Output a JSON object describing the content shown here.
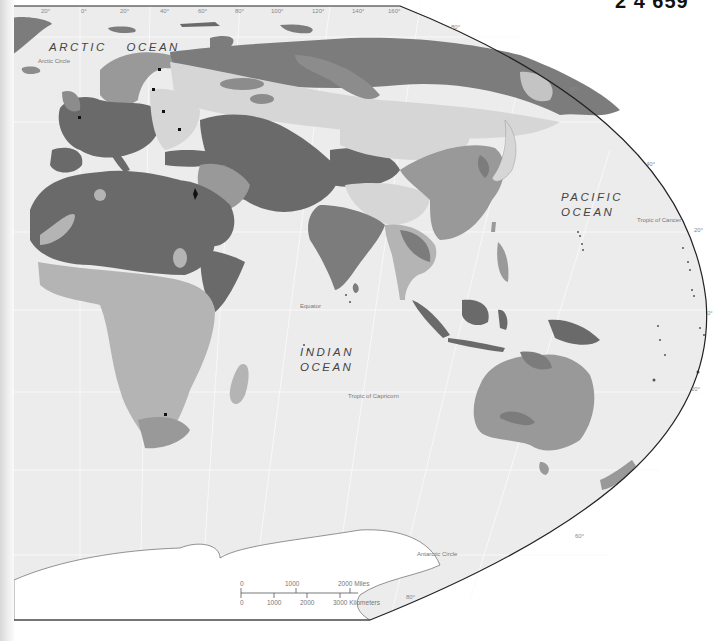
{
  "map": {
    "title_fragment": "2 4 659",
    "colors": {
      "ocean": "#ececec",
      "darkest": "#6a6a6a",
      "dark": "#7c7c7c",
      "medium": "#999999",
      "light": "#b4b4b4",
      "lightest": "#d6d6d6",
      "outside": "#ffffff",
      "border_line": "#222222"
    },
    "oceans": [
      {
        "id": "arctic",
        "line1": "ARCTIC",
        "line2": "OCEAN"
      },
      {
        "id": "pacific",
        "line1": "PACIFIC",
        "line2": "OCEAN"
      },
      {
        "id": "indian",
        "line1": "INDIAN",
        "line2": "OCEAN"
      }
    ],
    "reference_lines": {
      "arctic_circle": "Arctic Circle",
      "tropic_of_cancer": "Tropic of Cancer",
      "equator": "Equator",
      "tropic_of_capricorn": "Tropic of Capricorn",
      "antarctic_circle": "Antarctic Circle"
    },
    "longitude_ticks": [
      "20°",
      "0°",
      "20°",
      "40°",
      "60°",
      "80°",
      "100°",
      "120°",
      "140°",
      "160°"
    ],
    "latitude_ticks": [
      "80°",
      "60°",
      "40°",
      "20°",
      "0°",
      "20°",
      "60°",
      "80°"
    ],
    "scale_bar": {
      "miles": [
        "0",
        "1000",
        "2000 Miles"
      ],
      "kilometers": [
        "0",
        "1000",
        "2000",
        "3000 Kilometers"
      ]
    }
  }
}
